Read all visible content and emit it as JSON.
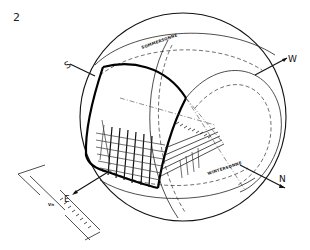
{
  "figure": {
    "number": "2",
    "type": "celestial sphere / sun-path projection sketch"
  },
  "labels": {
    "west": "W",
    "north": "N",
    "upper_left_marker": "S",
    "lower_left_marker": "E",
    "upper_arc_label": "SOMMERSONNE",
    "lower_arc_label": "WINTERSONNE",
    "offset_label": "Vn"
  }
}
